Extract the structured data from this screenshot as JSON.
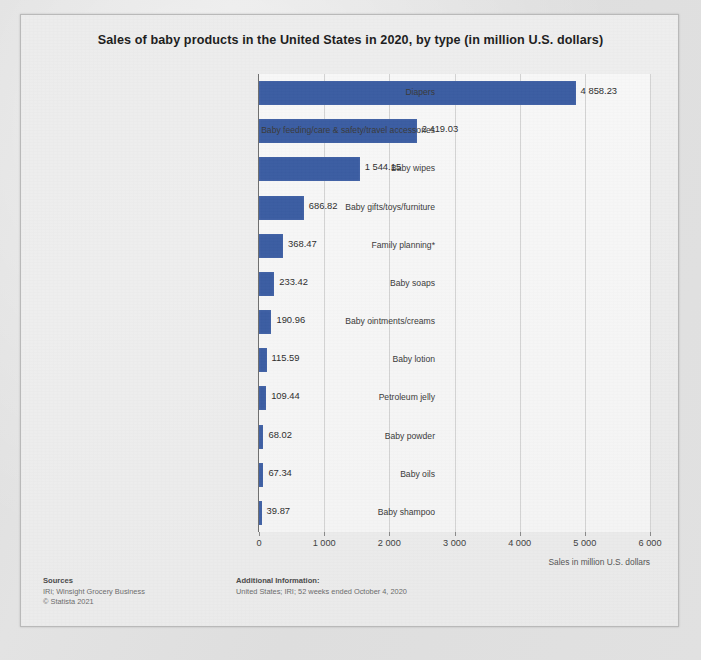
{
  "chart_data": {
    "type": "bar",
    "orientation": "horizontal",
    "title": "Sales of baby products in the United States in 2020, by type (in million U.S. dollars)",
    "xlabel": "Sales in million U.S. dollars",
    "ylabel": "",
    "xlim": [
      0,
      6000
    ],
    "xticks": [
      "0",
      "1 000",
      "2 000",
      "3 000",
      "4 000",
      "5 000",
      "6 000"
    ],
    "xtick_values": [
      0,
      1000,
      2000,
      3000,
      4000,
      5000,
      6000
    ],
    "grid": true,
    "legend": "none",
    "bar_color": "#3b5da2",
    "categories": [
      "Diapers",
      "Baby feeding/care & safety/travel accessories",
      "Baby wipes",
      "Baby gifts/toys/furniture",
      "Family planning*",
      "Baby soaps",
      "Baby ointments/creams",
      "Baby lotion",
      "Petroleum jelly",
      "Baby powder",
      "Baby oils",
      "Baby shampoo"
    ],
    "values": [
      4858.23,
      2419.03,
      1544.15,
      686.82,
      368.47,
      233.42,
      190.96,
      115.59,
      109.44,
      68.02,
      67.34,
      39.87
    ],
    "value_labels": [
      "4 858.23",
      "2 419.03",
      "1 544.15",
      "686.82",
      "368.47",
      "233.42",
      "190.96",
      "115.59",
      "109.44",
      "68.02",
      "67.34",
      "39.87"
    ]
  },
  "footer": {
    "sources_heading": "Sources",
    "sources_line1": "IRi; Winsight Grocery Business",
    "sources_line2": "© Statista 2021",
    "additional_heading": "Additional Information:",
    "additional_line1": "United States; IRI; 52 weeks ended October 4, 2020"
  }
}
